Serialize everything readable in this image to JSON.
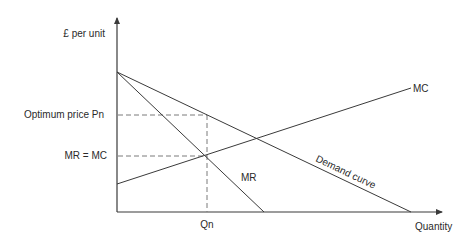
{
  "diagram": {
    "type": "economics-profit-maximisation",
    "colors": {
      "line": "#3a3a3a",
      "dashed": "#7a7a7a",
      "text": "#2a2a2a",
      "background": "#ffffff"
    },
    "axes": {
      "y_label": "£ per unit",
      "x_label": "Quantity"
    },
    "labels": {
      "optimum_price": "Optimum price Pn",
      "mr_equals_mc": "MR = MC",
      "quantity_marker": "Qn",
      "mc_curve": "MC",
      "mr_curve": "MR",
      "demand_curve": "Demand curve"
    },
    "curves": [
      {
        "name": "Demand curve",
        "from": [
          117,
          72
        ],
        "to": [
          411,
          212
        ]
      },
      {
        "name": "MR",
        "from": [
          117,
          72
        ],
        "to": [
          264,
          212
        ]
      },
      {
        "name": "MC",
        "from": [
          117,
          184
        ],
        "to": [
          411,
          88
        ]
      }
    ],
    "guides": {
      "qn_x": 207,
      "pn_y": 115,
      "mr_mc_y": 156
    }
  }
}
